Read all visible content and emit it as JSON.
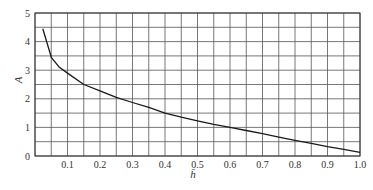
{
  "chart_data": {
    "type": "line",
    "title": "",
    "xlabel": "h̄",
    "ylabel": "A",
    "xlim": [
      0,
      1.0
    ],
    "ylim": [
      0,
      5
    ],
    "grid": true,
    "grid_x_step": 0.05,
    "grid_y_step": 0.5,
    "x_ticks": [
      0.1,
      0.2,
      0.3,
      0.4,
      0.5,
      0.6,
      0.7,
      0.8,
      0.9,
      1.0
    ],
    "x_tick_labels": [
      "0.1",
      "0.2",
      "0.3",
      "0.4",
      "0.5",
      "0.6",
      "0.7",
      "0.8",
      "0.9",
      "1.0"
    ],
    "y_ticks": [
      0,
      1,
      2,
      3,
      4,
      5
    ],
    "y_tick_labels": [
      "0",
      "1",
      "2",
      "3",
      "4",
      "5"
    ],
    "legend": null,
    "series": [
      {
        "name": "A",
        "x": [
          0.024,
          0.05,
          0.075,
          0.1,
          0.15,
          0.2,
          0.25,
          0.3,
          0.35,
          0.4,
          0.45,
          0.5,
          0.55,
          0.6,
          0.65,
          0.7,
          0.75,
          0.8,
          0.85,
          0.9,
          0.95,
          1.0
        ],
        "values": [
          4.45,
          3.45,
          3.1,
          2.9,
          2.5,
          2.28,
          2.05,
          1.87,
          1.7,
          1.5,
          1.36,
          1.23,
          1.11,
          1.0,
          0.89,
          0.78,
          0.66,
          0.55,
          0.44,
          0.33,
          0.23,
          0.13
        ]
      }
    ],
    "colors": {
      "line": "#1a1a1a",
      "grid": "#555555",
      "text": "#333333",
      "background": "#ffffff"
    }
  }
}
